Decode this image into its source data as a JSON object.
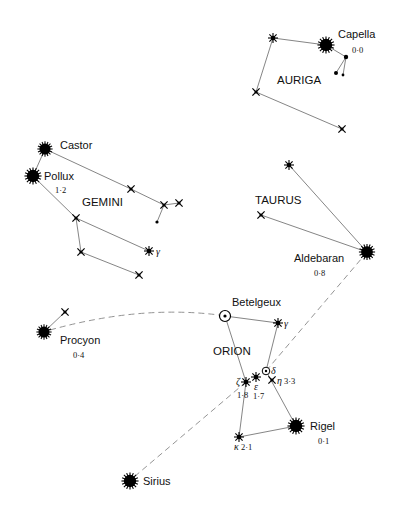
{
  "constellations": [
    {
      "name": "AURIGA",
      "label_pos": [
        278,
        84
      ]
    },
    {
      "name": "GEMINI",
      "label_pos": [
        82,
        206
      ]
    },
    {
      "name": "TAURUS",
      "label_pos": [
        255,
        204
      ]
    },
    {
      "name": "ORION",
      "label_pos": [
        213,
        355
      ]
    }
  ],
  "named_stars": [
    {
      "name": "Capella",
      "magnitude": "0·0",
      "x": 326,
      "y": 45,
      "type": "major"
    },
    {
      "name": "Castor",
      "magnitude": "",
      "x": 45,
      "y": 149,
      "type": "major"
    },
    {
      "name": "Pollux",
      "magnitude": "1·2",
      "x": 33,
      "y": 176,
      "type": "major"
    },
    {
      "name": "Aldebaran",
      "magnitude": "0·8",
      "x": 367,
      "y": 252,
      "type": "major"
    },
    {
      "name": "Procyon",
      "magnitude": "0·4",
      "x": 44,
      "y": 332,
      "type": "major"
    },
    {
      "name": "Betelgeux",
      "magnitude": "",
      "x": 225,
      "y": 316,
      "type": "variable"
    },
    {
      "name": "Rigel",
      "magnitude": "0·1",
      "x": 296,
      "y": 426,
      "type": "major"
    },
    {
      "name": "Sirius",
      "magnitude": "",
      "x": 130,
      "y": 481,
      "type": "major"
    }
  ],
  "greek_stars": [
    {
      "letter": "γ",
      "magnitude": "",
      "constellation": "Gemini",
      "x": 149,
      "y": 251
    },
    {
      "letter": "γ",
      "magnitude": "",
      "constellation": "Orion",
      "x": 278,
      "y": 323
    },
    {
      "letter": "δ",
      "magnitude": "",
      "constellation": "Orion",
      "x": 266,
      "y": 371
    },
    {
      "letter": "η",
      "magnitude": "3·3",
      "constellation": "Orion",
      "x": 272,
      "y": 380
    },
    {
      "letter": "ε",
      "magnitude": "1·7",
      "constellation": "Orion",
      "x": 256,
      "y": 377
    },
    {
      "letter": "ζ",
      "magnitude": "1·8",
      "constellation": "Orion",
      "x": 246,
      "y": 382
    },
    {
      "letter": "κ",
      "magnitude": "2·1",
      "constellation": "Orion",
      "x": 239,
      "y": 437
    }
  ],
  "pointer_lines": [
    {
      "from": "Betelgeux",
      "to": "Procyon",
      "style": "dashed"
    },
    {
      "from": "Orion belt",
      "to": "Aldebaran",
      "style": "dashed"
    },
    {
      "from": "Orion belt",
      "to": "Sirius",
      "style": "dashed"
    }
  ]
}
